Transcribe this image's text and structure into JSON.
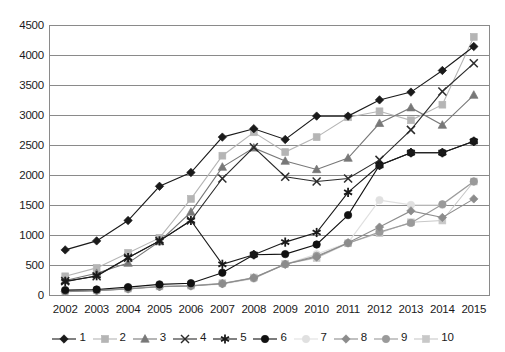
{
  "chart_data": {
    "type": "line",
    "title": "",
    "xlabel": "",
    "ylabel": "",
    "categories": [
      "2002",
      "2003",
      "2004",
      "2005",
      "2006",
      "2007",
      "2008",
      "2009",
      "2010",
      "2011",
      "2012",
      "2013",
      "2014",
      "2015"
    ],
    "ylim": [
      0,
      4500
    ],
    "ytick_values": [
      0,
      500,
      1000,
      1500,
      2000,
      2500,
      3000,
      3500,
      4000,
      4500
    ],
    "ytick_labels": [
      "0",
      "500",
      "1000",
      "1500",
      "2000",
      "2500",
      "3000",
      "3500",
      "4000",
      "4500"
    ],
    "grid": true,
    "legend_position": "bottom",
    "series": [
      {
        "name": "1",
        "marker": "diamond",
        "color": "#1a1a1a",
        "values": [
          760,
          910,
          1250,
          1820,
          2050,
          2640,
          2780,
          2600,
          2990,
          2990,
          3260,
          3390,
          3750,
          4150
        ]
      },
      {
        "name": "2",
        "marker": "square",
        "color": "#b5b5b5",
        "values": [
          320,
          460,
          710,
          960,
          1610,
          2330,
          2720,
          2390,
          2640,
          2970,
          3070,
          2920,
          3180,
          4310
        ]
      },
      {
        "name": "3",
        "marker": "triangle",
        "color": "#787878",
        "values": [
          250,
          370,
          540,
          900,
          1390,
          2140,
          2460,
          2240,
          2100,
          2290,
          2870,
          3130,
          2840,
          3340
        ]
      },
      {
        "name": "4",
        "marker": "x",
        "color": "#2b2b2b",
        "values": [
          240,
          320,
          630,
          910,
          1250,
          1950,
          2470,
          1980,
          1900,
          1950,
          2260,
          2760,
          3400,
          3870
        ]
      },
      {
        "name": "5",
        "marker": "star",
        "color": "#1a1a1a",
        "values": [
          230,
          330,
          630,
          910,
          1250,
          520,
          680,
          890,
          1050,
          1720,
          2170,
          2380,
          2380,
          2570
        ]
      },
      {
        "name": "6",
        "marker": "circle",
        "color": "#111111",
        "values": [
          90,
          100,
          140,
          185,
          205,
          380,
          680,
          690,
          850,
          1340,
          2170,
          2380,
          2380,
          2570
        ]
      },
      {
        "name": "7",
        "marker": "circle-light",
        "color": "#e0e0e0",
        "values": [
          70,
          80,
          110,
          150,
          160,
          190,
          280,
          520,
          690,
          880,
          1590,
          1510,
          1510,
          1900
        ]
      },
      {
        "name": "8",
        "marker": "diamond-gray",
        "color": "#8c8c8c",
        "values": [
          65,
          78,
          108,
          145,
          158,
          195,
          295,
          520,
          640,
          880,
          1140,
          1410,
          1300,
          1610
        ]
      },
      {
        "name": "9",
        "marker": "circle-gray",
        "color": "#9a9a9a",
        "values": [
          68,
          82,
          112,
          150,
          162,
          200,
          290,
          520,
          660,
          870,
          1060,
          1210,
          1520,
          1900
        ]
      },
      {
        "name": "10",
        "marker": "square-light",
        "color": "#c8c8c8",
        "values": [
          72,
          85,
          115,
          152,
          165,
          205,
          300,
          525,
          625,
          870,
          1040,
          1220,
          1250,
          1900
        ]
      }
    ]
  },
  "legend": {
    "items": [
      {
        "label": "1"
      },
      {
        "label": "2"
      },
      {
        "label": "3"
      },
      {
        "label": "4"
      },
      {
        "label": "5"
      },
      {
        "label": "6"
      },
      {
        "label": "7"
      },
      {
        "label": "8"
      },
      {
        "label": "9"
      },
      {
        "label": "10"
      }
    ]
  }
}
